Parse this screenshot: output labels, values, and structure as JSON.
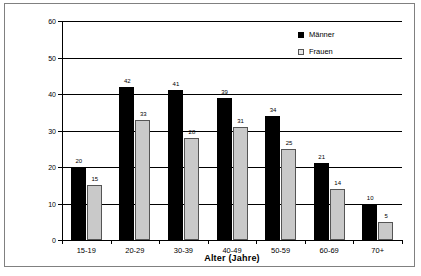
{
  "chart_data": {
    "type": "bar",
    "title": "",
    "xlabel": "Alter (Jahre)",
    "ylabel": "Prozent",
    "categories": [
      "15-19",
      "20-29",
      "30-39",
      "40-49",
      "50-59",
      "60-69",
      "70+"
    ],
    "series": [
      {
        "name": "Männer",
        "values": [
          20,
          42,
          41,
          39,
          34,
          21,
          10
        ],
        "color": "#000000"
      },
      {
        "name": "Frauen",
        "values": [
          15,
          33,
          28,
          31,
          25,
          14,
          5
        ],
        "color": "#c9c9c9"
      }
    ],
    "ylim": [
      0,
      60
    ],
    "yticks": [
      0,
      10,
      20,
      30,
      40,
      50,
      60
    ],
    "ytick_labels": [
      "0",
      "10",
      "20",
      "30",
      "40",
      "50",
      "60"
    ],
    "grid": "horizontal",
    "legend_position": "top-right",
    "data_labels": true
  },
  "legend": {
    "entries": [
      {
        "label": "Männer",
        "swatch": "black-filled-square"
      },
      {
        "label": "Frauen",
        "swatch": "light-gray-square"
      }
    ]
  }
}
